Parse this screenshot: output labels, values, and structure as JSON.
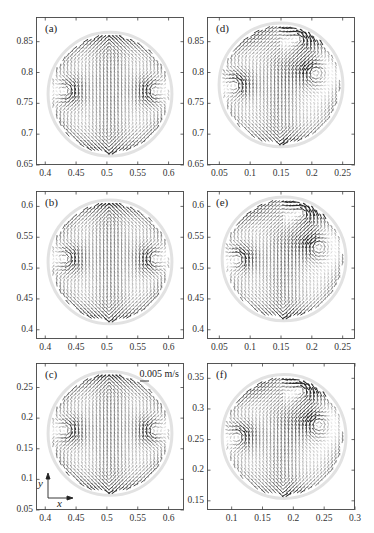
{
  "figure": {
    "scale_bar_label": "0.005 m/s",
    "axis_indicator": {
      "x_label": "x",
      "y_label": "y"
    }
  },
  "chart_data": [
    {
      "type": "quiver",
      "panel": "(a)",
      "xlim": [
        0.385,
        0.625
      ],
      "ylim": [
        0.65,
        0.89
      ],
      "xticks": [
        0.4,
        0.45,
        0.5,
        0.55,
        0.6
      ],
      "xtick_labels": [
        "0.4",
        "0.45",
        "0.5",
        "0.55",
        "0.6"
      ],
      "yticks": [
        0.65,
        0.7,
        0.75,
        0.8,
        0.85
      ],
      "ytick_labels": [
        "0.65",
        "0.7",
        "0.75",
        "0.8",
        "0.85"
      ],
      "circle_center": [
        0.505,
        0.765
      ],
      "circle_radius": 0.1,
      "pattern": "symmetric-vortex-pair",
      "description": "Symmetric velocity field: strong upward central jet, counter-rotating vortex pair at mid-height near left and right edges."
    },
    {
      "type": "quiver",
      "panel": "(b)",
      "xlim": [
        0.385,
        0.625
      ],
      "ylim": [
        0.385,
        0.625
      ],
      "xticks": [
        0.4,
        0.45,
        0.5,
        0.55,
        0.6
      ],
      "xtick_labels": [
        "0.4",
        "0.45",
        "0.5",
        "0.55",
        "0.6"
      ],
      "yticks": [
        0.4,
        0.45,
        0.5,
        0.55,
        0.6
      ],
      "ytick_labels": [
        "0.4",
        "0.45",
        "0.5",
        "0.55",
        "0.6"
      ],
      "circle_center": [
        0.505,
        0.51
      ],
      "circle_radius": 0.1,
      "pattern": "symmetric-vortex-pair",
      "description": "Symmetric velocity field similar to (a), vortex pair around y=0.5."
    },
    {
      "type": "quiver",
      "panel": "(c)",
      "xlim": [
        0.385,
        0.625
      ],
      "ylim": [
        0.05,
        0.29
      ],
      "xticks": [
        0.4,
        0.45,
        0.5,
        0.55,
        0.6
      ],
      "xtick_labels": [
        "0.4",
        "0.45",
        "0.5",
        "0.55",
        "0.6"
      ],
      "yticks": [
        0.05,
        0.1,
        0.15,
        0.2,
        0.25
      ],
      "ytick_labels": [
        "0.05",
        "0.1",
        "0.15",
        "0.2",
        "0.25"
      ],
      "circle_center": [
        0.505,
        0.175
      ],
      "circle_radius": 0.1,
      "pattern": "symmetric-vortex-pair",
      "annotations": [
        "0.005 m/s scale bar",
        "x-y axis indicator"
      ],
      "description": "Symmetric velocity field with vortex pair near y=0.16."
    },
    {
      "type": "quiver",
      "panel": "(d)",
      "xlim": [
        0.03,
        0.27
      ],
      "ylim": [
        0.65,
        0.89
      ],
      "xticks": [
        0.05,
        0.1,
        0.15,
        0.2,
        0.25
      ],
      "xtick_labels": [
        "0.05",
        "0.1",
        "0.15",
        "0.2",
        "0.25"
      ],
      "yticks": [
        0.65,
        0.7,
        0.75,
        0.8,
        0.85
      ],
      "ytick_labels": [
        "0.65",
        "0.7",
        "0.75",
        "0.8",
        "0.85"
      ],
      "circle_center": [
        0.15,
        0.78
      ],
      "circle_radius": 0.1,
      "pattern": "asymmetric",
      "description": "Asymmetric velocity field with strong circulation at the upper right and lower-left edges."
    },
    {
      "type": "quiver",
      "panel": "(e)",
      "xlim": [
        0.03,
        0.27
      ],
      "ylim": [
        0.385,
        0.625
      ],
      "xticks": [
        0.05,
        0.1,
        0.15,
        0.2,
        0.25
      ],
      "xtick_labels": [
        "0.05",
        "0.1",
        "0.15",
        "0.2",
        "0.25"
      ],
      "yticks": [
        0.4,
        0.45,
        0.5,
        0.55,
        0.6
      ],
      "ytick_labels": [
        "0.4",
        "0.45",
        "0.5",
        "0.55",
        "0.6"
      ],
      "circle_center": [
        0.155,
        0.515
      ],
      "circle_radius": 0.1,
      "pattern": "asymmetric",
      "description": "Asymmetric velocity field with vortices on left and right near y=0.51."
    },
    {
      "type": "quiver",
      "panel": "(f)",
      "xlim": [
        0.06,
        0.3
      ],
      "ylim": [
        0.135,
        0.375
      ],
      "xticks": [
        0.1,
        0.15,
        0.2,
        0.25,
        0.3
      ],
      "xtick_labels": [
        "0.1",
        "0.15",
        "0.2",
        "0.25",
        "0.3"
      ],
      "yticks": [
        0.15,
        0.2,
        0.25,
        0.3,
        0.35
      ],
      "ytick_labels": [
        "0.15",
        "0.2",
        "0.25",
        "0.3",
        "0.35"
      ],
      "circle_center": [
        0.185,
        0.255
      ],
      "circle_radius": 0.1,
      "pattern": "asymmetric",
      "description": "Asymmetric velocity field with a vortex at lower-left near y=0.23."
    }
  ],
  "panels_layout": [
    {
      "label": "(a)",
      "left": 36,
      "top": 17,
      "width": 148,
      "height": 148
    },
    {
      "label": "(b)",
      "left": 36,
      "top": 191,
      "width": 148,
      "height": 148
    },
    {
      "label": "(c)",
      "left": 36,
      "top": 363,
      "width": 148,
      "height": 147
    },
    {
      "label": "(d)",
      "left": 207,
      "top": 17,
      "width": 148,
      "height": 148
    },
    {
      "label": "(e)",
      "left": 207,
      "top": 191,
      "width": 148,
      "height": 148
    },
    {
      "label": "(f)",
      "left": 207,
      "top": 363,
      "width": 148,
      "height": 147
    }
  ]
}
